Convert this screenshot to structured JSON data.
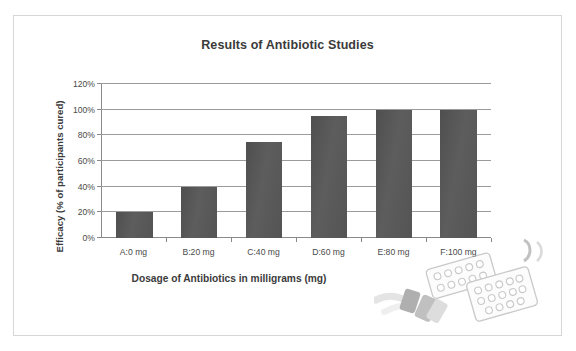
{
  "figure": {
    "title": "Results of Antibiotic Studies",
    "border_color": "#d6d6d6",
    "background": "#ffffff"
  },
  "chart_data": {
    "type": "bar",
    "title": "Results of Antibiotic Studies",
    "xlabel": "Dosage of Antibiotics in milligrams (mg)",
    "ylabel": "Efficacy (% of participants cured)",
    "categories": [
      "A:0 mg",
      "B:20 mg",
      "C:40 mg",
      "D:60 mg",
      "E:80 mg",
      "F:100 mg"
    ],
    "values": [
      20,
      40,
      75,
      95,
      100,
      100
    ],
    "value_unit": "%",
    "ylim": [
      0,
      120
    ],
    "ytick_step": 20,
    "ytick_labels": [
      "0%",
      "20%",
      "40%",
      "60%",
      "80%",
      "100%",
      "120%"
    ],
    "ytick_values": [
      0,
      20,
      40,
      60,
      80,
      100,
      120
    ],
    "grid": "horizontal",
    "legend": "none",
    "bar_color": "#575757",
    "gridline_color": "#9b9b9b",
    "axis_color": "#8a8a8a",
    "series": [
      {
        "name": "Efficacy",
        "points": [
          {
            "category": "A:0 mg",
            "dosage_mg": 0,
            "value": 20
          },
          {
            "category": "B:20 mg",
            "dosage_mg": 20,
            "value": 40
          },
          {
            "category": "C:40 mg",
            "dosage_mg": 40,
            "value": 75
          },
          {
            "category": "D:60 mg",
            "dosage_mg": 60,
            "value": 95
          },
          {
            "category": "E:80 mg",
            "dosage_mg": 80,
            "value": 100
          },
          {
            "category": "F:100 mg",
            "dosage_mg": 100,
            "value": 100
          }
        ]
      }
    ]
  },
  "artwork": {
    "name": "pill-blister-pack-illustration",
    "description": "grayscale illustration of blister packs of pills and capsules"
  }
}
